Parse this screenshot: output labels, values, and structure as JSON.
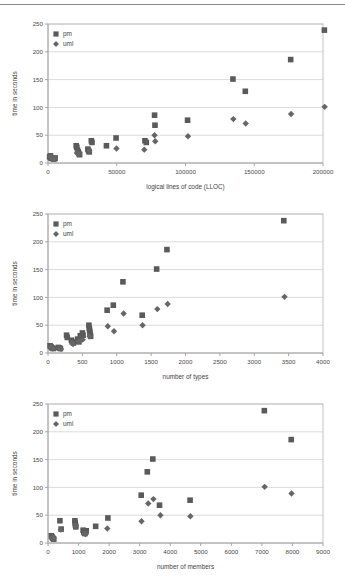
{
  "page": {
    "top_rule": true
  },
  "legend": {
    "position": "top-left-inside",
    "entries": [
      {
        "label": "pm",
        "marker": "square",
        "color": "#5a5a5a"
      },
      {
        "label": "uml",
        "marker": "diamond",
        "color": "#666666"
      }
    ]
  },
  "chart_data": [
    {
      "type": "scatter",
      "title": "",
      "xlabel": "logical lines of code (LLOC)",
      "ylabel": "time in seconds",
      "xlim": [
        0,
        200000
      ],
      "ylim": [
        0,
        250
      ],
      "xticks": [
        0,
        50000,
        100000,
        150000,
        200000
      ],
      "yticks": [
        0,
        50,
        100,
        150,
        200,
        250
      ],
      "xtick_labels": [
        "0",
        "50000",
        "100000",
        "150000",
        "200000"
      ],
      "ytick_labels": [
        "0",
        "50",
        "100",
        "150",
        "200",
        "250"
      ],
      "grid": "horizontal",
      "legend": [
        "pm",
        "uml"
      ],
      "series": [
        {
          "name": "pm",
          "marker": "square",
          "color": "#5a5a5a",
          "points": [
            [
              1200,
              11
            ],
            [
              1800,
              13
            ],
            [
              2200,
              9
            ],
            [
              3000,
              8
            ],
            [
              3600,
              9
            ],
            [
              4200,
              7
            ],
            [
              4800,
              8
            ],
            [
              5200,
              9
            ],
            [
              20500,
              31
            ],
            [
              21000,
              28
            ],
            [
              21500,
              23
            ],
            [
              22000,
              20
            ],
            [
              22500,
              17
            ],
            [
              23000,
              15
            ],
            [
              29000,
              25
            ],
            [
              29500,
              22
            ],
            [
              30000,
              20
            ],
            [
              31500,
              40
            ],
            [
              32000,
              37
            ],
            [
              42500,
              31
            ],
            [
              49500,
              45
            ],
            [
              70500,
              40
            ],
            [
              71500,
              37
            ],
            [
              77500,
              86
            ],
            [
              77800,
              68
            ],
            [
              101500,
              77
            ],
            [
              134500,
              151
            ],
            [
              143500,
              129
            ],
            [
              176500,
              186
            ],
            [
              201000,
              239
            ]
          ]
        },
        {
          "name": "uml",
          "marker": "diamond",
          "color": "#666666",
          "points": [
            [
              1500,
              12
            ],
            [
              2500,
              9
            ],
            [
              3800,
              8
            ],
            [
              5000,
              8
            ],
            [
              21000,
              18
            ],
            [
              22500,
              16
            ],
            [
              30000,
              22
            ],
            [
              49800,
              26
            ],
            [
              70000,
              24
            ],
            [
              77500,
              50
            ],
            [
              78000,
              39
            ],
            [
              101800,
              48
            ],
            [
              134800,
              79
            ],
            [
              143800,
              71
            ],
            [
              176800,
              88
            ],
            [
              201200,
              101
            ]
          ]
        }
      ]
    },
    {
      "type": "scatter",
      "title": "",
      "xlabel": "number of types",
      "ylabel": "time in seconds",
      "xlim": [
        0,
        4000
      ],
      "ylim": [
        0,
        250
      ],
      "xticks": [
        0,
        500,
        1000,
        1500,
        2000,
        2500,
        3000,
        3500,
        4000
      ],
      "yticks": [
        0,
        50,
        100,
        150,
        200,
        250
      ],
      "xtick_labels": [
        "0",
        "500",
        "1000",
        "1500",
        "2000",
        "2500",
        "3000",
        "3500",
        "4000"
      ],
      "ytick_labels": [
        "0",
        "50",
        "100",
        "150",
        "200",
        "250"
      ],
      "grid": "horizontal",
      "legend": [
        "pm",
        "uml"
      ],
      "series": [
        {
          "name": "pm",
          "marker": "square",
          "color": "#5a5a5a",
          "points": [
            [
              30,
              13
            ],
            [
              45,
              11
            ],
            [
              60,
              9
            ],
            [
              75,
              8
            ],
            [
              150,
              10
            ],
            [
              165,
              9
            ],
            [
              180,
              8
            ],
            [
              270,
              32
            ],
            [
              280,
              28
            ],
            [
              340,
              23
            ],
            [
              355,
              20
            ],
            [
              370,
              18
            ],
            [
              430,
              25
            ],
            [
              440,
              22
            ],
            [
              450,
              20
            ],
            [
              470,
              31
            ],
            [
              480,
              28
            ],
            [
              500,
              36
            ],
            [
              510,
              32
            ],
            [
              595,
              50
            ],
            [
              600,
              45
            ],
            [
              605,
              41
            ],
            [
              610,
              37
            ],
            [
              615,
              33
            ],
            [
              620,
              30
            ],
            [
              860,
              77
            ],
            [
              950,
              86
            ],
            [
              1090,
              128
            ],
            [
              1370,
              68
            ],
            [
              1580,
              151
            ],
            [
              1730,
              186
            ],
            [
              3430,
              238
            ]
          ]
        },
        {
          "name": "uml",
          "marker": "diamond",
          "color": "#666666",
          "points": [
            [
              40,
              11
            ],
            [
              70,
              8
            ],
            [
              160,
              9
            ],
            [
              190,
              7
            ],
            [
              350,
              18
            ],
            [
              365,
              16
            ],
            [
              445,
              21
            ],
            [
              505,
              24
            ],
            [
              605,
              30
            ],
            [
              870,
              48
            ],
            [
              960,
              39
            ],
            [
              1100,
              71
            ],
            [
              1375,
              50
            ],
            [
              1590,
              79
            ],
            [
              1740,
              88
            ],
            [
              3440,
              101
            ]
          ]
        }
      ]
    },
    {
      "type": "scatter",
      "title": "",
      "xlabel": "number of members",
      "ylabel": "time in seconds",
      "xlim": [
        0,
        9000
      ],
      "ylim": [
        0,
        250
      ],
      "xticks": [
        0,
        1000,
        2000,
        3000,
        4000,
        5000,
        6000,
        7000,
        8000,
        9000
      ],
      "yticks": [
        0,
        50,
        100,
        150,
        200,
        250
      ],
      "xtick_labels": [
        "0",
        "1000",
        "2000",
        "3000",
        "4000",
        "5000",
        "6000",
        "7000",
        "8000",
        "9000"
      ],
      "ytick_labels": [
        "0",
        "50",
        "100",
        "150",
        "200",
        "250"
      ],
      "grid": "horizontal",
      "legend": [
        "pm",
        "uml"
      ],
      "series": [
        {
          "name": "pm",
          "marker": "square",
          "color": "#5a5a5a",
          "points": [
            [
              110,
              13
            ],
            [
              130,
              11
            ],
            [
              150,
              9
            ],
            [
              170,
              8
            ],
            [
              190,
              7
            ],
            [
              390,
              40
            ],
            [
              430,
              25
            ],
            [
              880,
              40
            ],
            [
              890,
              36
            ],
            [
              900,
              32
            ],
            [
              910,
              29
            ],
            [
              1150,
              23
            ],
            [
              1170,
              20
            ],
            [
              1190,
              18
            ],
            [
              1210,
              17
            ],
            [
              1230,
              20
            ],
            [
              1250,
              22
            ],
            [
              1560,
              30
            ],
            [
              1960,
              45
            ],
            [
              3050,
              86
            ],
            [
              3250,
              128
            ],
            [
              3430,
              151
            ],
            [
              3650,
              68
            ],
            [
              4650,
              77
            ],
            [
              7080,
              238
            ],
            [
              7960,
              186
            ]
          ]
        },
        {
          "name": "uml",
          "marker": "diamond",
          "color": "#666666",
          "points": [
            [
              140,
              10
            ],
            [
              180,
              8
            ],
            [
              420,
              24
            ],
            [
              900,
              31
            ],
            [
              1200,
              17
            ],
            [
              1230,
              16
            ],
            [
              1940,
              26
            ],
            [
              3060,
              39
            ],
            [
              3280,
              71
            ],
            [
              3450,
              79
            ],
            [
              3680,
              50
            ],
            [
              4660,
              48
            ],
            [
              7090,
              101
            ],
            [
              7970,
              89
            ]
          ]
        }
      ]
    }
  ]
}
